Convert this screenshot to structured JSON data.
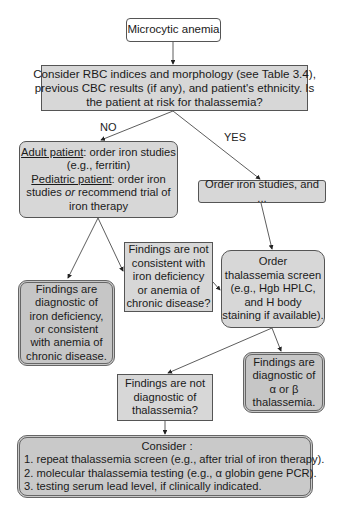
{
  "diagram": {
    "start": {
      "label": "Microcytic anemia"
    },
    "consider_rbc": {
      "lines": [
        "Consider RBC indices and morphology (see Table 3.4),",
        "previous CBC results (if any), and patient's ethnicity. Is",
        "the patient at risk for thalassemia?"
      ]
    },
    "branch_labels": {
      "no": "NO",
      "yes": "YES"
    },
    "iron_studies_no": {
      "adult_label": "Adult patient",
      "adult_text": ": order iron studies",
      "adult_example": "(e.g., ferritin)",
      "pediatric_label": "Pediatric patient",
      "pediatric_text": ": order iron",
      "pediatric_line2_a": "studies ",
      "pediatric_line2_or": "or",
      "pediatric_line2_b": " recommend trial of",
      "pediatric_line3": "iron therapy"
    },
    "iron_studies_yes": {
      "label": "Order iron studies, and ..."
    },
    "not_consistent": {
      "lines": [
        "Findings are not",
        "consistent with",
        "iron deficiency",
        "or anemia of",
        "chronic disease?"
      ]
    },
    "thal_screen": {
      "lines": [
        "Order",
        "thalassemia screen",
        "(e.g., Hgb HPLC,",
        "and H body",
        "staining if available)."
      ]
    },
    "diag_iron": {
      "lines": [
        "Findings are",
        "diagnostic of",
        "iron deficiency,",
        "or consistent",
        "with anemia of",
        "chronic disease."
      ]
    },
    "diag_thal": {
      "lines": [
        "Findings are",
        "diagnostic of",
        "α or β",
        "thalassemia."
      ]
    },
    "not_diag_thal": {
      "lines": [
        "Findings are not",
        "diagnostic of",
        "thalassemia?"
      ]
    },
    "consider_final": {
      "title": "Consider :",
      "items": [
        "1. repeat thalassemia screen (e.g., after trial of iron therapy).",
        "2. molecular thalassemia testing (e.g., α globin gene PCR).",
        "3. testing serum lead level, if clinically indicated."
      ]
    },
    "colors": {
      "box_fill": "#d7d7d7",
      "result_fill": "#c6c6c6",
      "stroke": "#555555"
    }
  }
}
